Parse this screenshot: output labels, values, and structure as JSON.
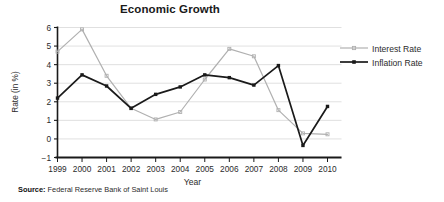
{
  "chart_data": {
    "type": "line",
    "title": "Economic Growth",
    "xlabel": "Year",
    "ylabel": "Rate (in %)",
    "categories": [
      "1999",
      "2000",
      "2001",
      "2002",
      "2003",
      "2004",
      "2005",
      "2006",
      "2007",
      "2008",
      "2009",
      "2010"
    ],
    "ylim": [
      -1,
      6
    ],
    "yticks": [
      "-1",
      "0",
      "1",
      "2",
      "3",
      "4",
      "5",
      "6"
    ],
    "grid": true,
    "legend_position": "right",
    "series": [
      {
        "name": "Interest Rate",
        "color": "#b0b0b0",
        "values": [
          4.7,
          5.9,
          3.4,
          1.65,
          1.05,
          1.45,
          3.2,
          4.85,
          4.45,
          1.55,
          0.3,
          0.25
        ]
      },
      {
        "name": "Inflation Rate",
        "color": "#1a1a1a",
        "values": [
          2.2,
          3.45,
          2.85,
          1.65,
          2.4,
          2.8,
          3.45,
          3.3,
          2.9,
          3.95,
          -0.35,
          1.75
        ]
      }
    ]
  },
  "source": {
    "label": "Source:",
    "text": "Federal Reserve Bank of Saint Louis"
  }
}
